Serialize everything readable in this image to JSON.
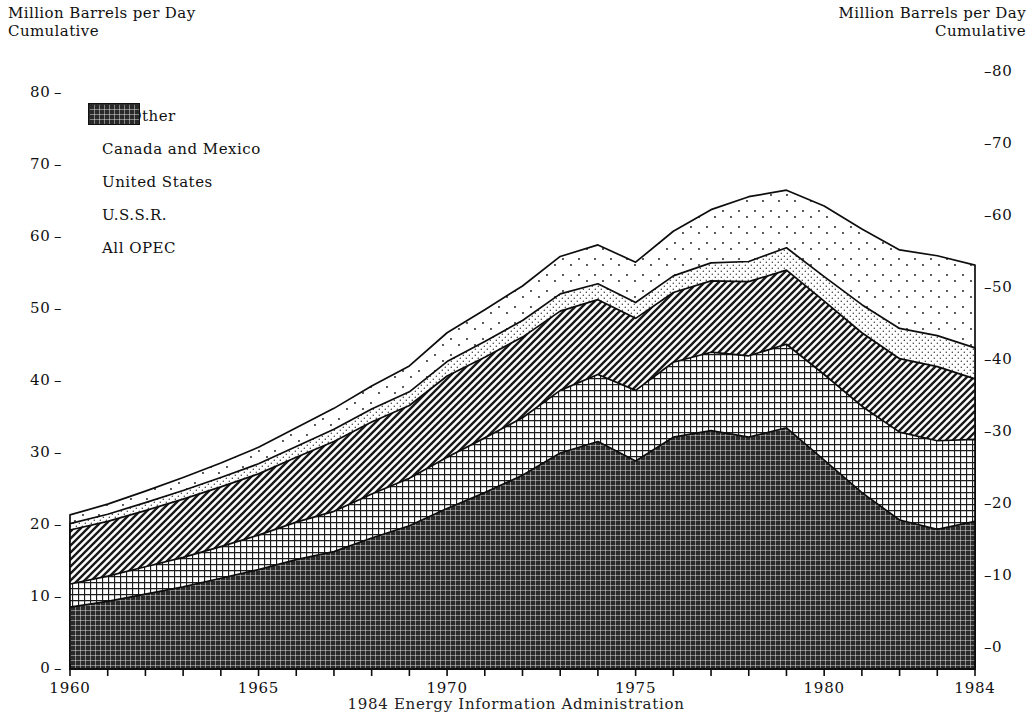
{
  "titles": {
    "left": "Million Barrels per Day\nCumulative",
    "right": "Million Barrels per Day\nCumulative"
  },
  "source": "1984 Energy Information Administration",
  "legend": [
    {
      "label": "All Other",
      "pattern": "sparse-dots",
      "name": "legend-swatch-all-other"
    },
    {
      "label": "Canada and Mexico",
      "pattern": "fine-dots",
      "name": "legend-swatch-canada-mexico"
    },
    {
      "label": "United States",
      "pattern": "diagonal",
      "name": "legend-swatch-united-states"
    },
    {
      "label": "U.S.S.R.",
      "pattern": "grid",
      "name": "legend-swatch-ussr"
    },
    {
      "label": "All OPEC",
      "pattern": "dense-grid",
      "name": "legend-swatch-all-opec"
    }
  ],
  "chart_data": {
    "type": "area",
    "stacked": true,
    "title": "Million Barrels per Day Cumulative",
    "xlabel": "",
    "ylabel": "Million Barrels per Day",
    "xlim": [
      1960,
      1984
    ],
    "ylim": [
      0,
      80
    ],
    "y_left_ticks": [
      0,
      10,
      20,
      30,
      40,
      50,
      60,
      70,
      80
    ],
    "y_right_ticks": [
      0,
      10,
      20,
      30,
      40,
      50,
      60,
      70,
      80
    ],
    "y_right_offset_note": "right axis drawn ~21px higher than left axis",
    "x_ticks_labeled": [
      1960,
      1965,
      1970,
      1975,
      1980,
      1984
    ],
    "x_ticks_minor_every": 1,
    "grid": false,
    "legend_position": "upper-left",
    "x": [
      1960,
      1961,
      1962,
      1963,
      1964,
      1965,
      1966,
      1967,
      1968,
      1969,
      1970,
      1971,
      1972,
      1973,
      1974,
      1975,
      1976,
      1977,
      1978,
      1979,
      1980,
      1981,
      1982,
      1983,
      1984
    ],
    "series": [
      {
        "name": "All OPEC",
        "values": [
          8.6,
          9.4,
          10.4,
          11.4,
          12.6,
          13.8,
          15.2,
          16.3,
          18.2,
          19.9,
          22.3,
          24.5,
          26.9,
          30.0,
          31.6,
          28.9,
          32.2,
          33.1,
          32.2,
          33.5,
          29.0,
          24.5,
          20.7,
          19.4,
          20.5
        ]
      },
      {
        "name": "U.S.S.R.",
        "values": [
          3.2,
          3.5,
          3.8,
          4.1,
          4.4,
          4.8,
          5.2,
          5.6,
          6.1,
          6.6,
          7.1,
          7.6,
          8.0,
          8.7,
          9.3,
          9.8,
          10.4,
          10.9,
          11.3,
          11.6,
          11.9,
          12.0,
          12.2,
          12.3,
          11.4
        ]
      },
      {
        "name": "United States",
        "values": [
          7.5,
          7.6,
          7.8,
          8.1,
          8.3,
          8.5,
          9.0,
          9.7,
          10.0,
          10.1,
          11.3,
          11.2,
          11.2,
          11.0,
          10.4,
          10.0,
          9.7,
          9.9,
          10.3,
          10.3,
          10.2,
          10.2,
          10.2,
          10.3,
          8.4
        ]
      },
      {
        "name": "Canada and Mexico",
        "values": [
          0.9,
          1.0,
          1.1,
          1.2,
          1.3,
          1.4,
          1.5,
          1.7,
          1.8,
          1.9,
          2.0,
          2.2,
          2.3,
          2.4,
          2.2,
          2.2,
          2.3,
          2.5,
          2.8,
          3.1,
          3.4,
          3.9,
          4.2,
          4.3,
          4.3
        ]
      },
      {
        "name": "All Other",
        "values": [
          1.2,
          1.4,
          1.6,
          1.8,
          2.0,
          2.3,
          2.6,
          2.9,
          3.2,
          3.6,
          4.0,
          4.4,
          4.8,
          5.2,
          5.4,
          5.6,
          6.2,
          7.4,
          9.0,
          8.0,
          9.8,
          10.5,
          10.9,
          11.1,
          11.5
        ]
      }
    ],
    "totals": [
      21.4,
      22.9,
      24.7,
      26.6,
      28.6,
      30.8,
      33.5,
      36.2,
      39.3,
      42.1,
      46.7,
      49.9,
      53.2,
      57.3,
      58.9,
      56.5,
      60.8,
      63.8,
      65.6,
      66.5,
      64.3,
      61.1,
      58.2,
      57.4,
      56.1
    ]
  }
}
